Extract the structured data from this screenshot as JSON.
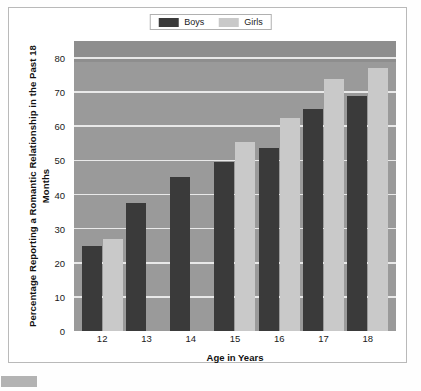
{
  "legend": {
    "items": [
      {
        "label": "Boys",
        "color": "#3a3a3a",
        "swatch_name": "legend-swatch-boys"
      },
      {
        "label": "Girls",
        "color": "#c9c9c9",
        "swatch_name": "legend-swatch-girls"
      }
    ]
  },
  "axes": {
    "ylabel": "Percentage Reporting a Romantic Relationship in the Past 18 Months",
    "xlabel": "Age in Years",
    "yticks": [
      "0",
      "10",
      "20",
      "30",
      "40",
      "50",
      "60",
      "70",
      "80"
    ],
    "xticks": [
      "12",
      "13",
      "14",
      "15",
      "16",
      "17",
      "18"
    ]
  },
  "colors": {
    "plot_background": "#9a9a9a",
    "gridline": "#f0f0f0",
    "boys": "#3a3a3a",
    "girls": "#c9c9c9",
    "frame": "#b9b9b9",
    "page": "#ffffff"
  },
  "chart_data": {
    "type": "bar",
    "title": "",
    "xlabel": "Age in Years",
    "ylabel": "Percentage Reporting a Romantic Relationship in the Past 18 Months",
    "categories": [
      "12",
      "13",
      "14",
      "15",
      "16",
      "17",
      "18"
    ],
    "series": [
      {
        "name": "Boys",
        "color": "#3a3a3a",
        "values": [
          25,
          37.5,
          45,
          49.5,
          53.5,
          65,
          69
        ]
      },
      {
        "name": "Girls",
        "color": "#c9c9c9",
        "values": [
          27,
          null,
          null,
          55.5,
          62.5,
          74,
          77
        ]
      }
    ],
    "ylim": [
      0,
      85
    ],
    "yticks": [
      0,
      10,
      20,
      30,
      40,
      50,
      60,
      70,
      80
    ],
    "grid": "horizontal",
    "legend_position": "top-center"
  }
}
